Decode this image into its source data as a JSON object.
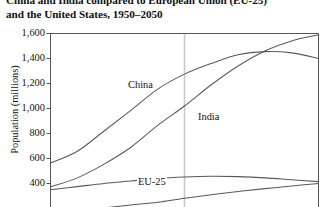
{
  "chart_data": {
    "type": "line",
    "title": "China and India compared to European Union (EU-25) and the United States, 1950–2050",
    "title_lines": [
      "China and India compared to European Union (EU-25)",
      "and the United States, 1950–2050"
    ],
    "xlabel": "",
    "ylabel": "Population (millions)",
    "ylim": [
      300,
      1700
    ],
    "xlim": [
      1950,
      2050
    ],
    "ytick_values": [
      1600,
      1400,
      1200,
      1000,
      800,
      600,
      400
    ],
    "ytick_labels": [
      "1,600",
      "1,400",
      "1,200",
      "1,000",
      "800",
      "600",
      "400"
    ],
    "grid": false,
    "legend_position": "inline-labels",
    "annotations": [
      {
        "text": "China",
        "x": 1978,
        "y": 1010
      },
      {
        "text": "India",
        "x": 2002,
        "y": 760
      },
      {
        "text": "EU-25",
        "x": 1983,
        "y": 440
      }
    ],
    "reference_line": {
      "x": 2000,
      "color": "#c9c9c9",
      "label": ""
    },
    "x": [
      1950,
      1960,
      1970,
      1980,
      1990,
      2000,
      2010,
      2020,
      2030,
      2040,
      2050
    ],
    "series": [
      {
        "name": "China",
        "color": "#595959",
        "values": [
          563,
          658,
          820,
          985,
          1155,
          1275,
          1360,
          1430,
          1455,
          1445,
          1400
        ]
      },
      {
        "name": "India",
        "color": "#595959",
        "values": [
          372,
          445,
          555,
          690,
          865,
          1020,
          1190,
          1340,
          1460,
          1540,
          1590
        ]
      },
      {
        "name": "EU-25",
        "color": "#595959",
        "values": [
          350,
          375,
          400,
          420,
          440,
          452,
          458,
          455,
          445,
          430,
          415
        ]
      },
      {
        "name": "United States",
        "color": "#595959",
        "values": [
          158,
          181,
          205,
          228,
          250,
          282,
          310,
          336,
          359,
          380,
          400
        ]
      }
    ],
    "colors": {
      "axis": "#555555",
      "line": "#595959",
      "reference": "#c9c9c9",
      "text": "#141414",
      "background": "#ffffff"
    }
  }
}
